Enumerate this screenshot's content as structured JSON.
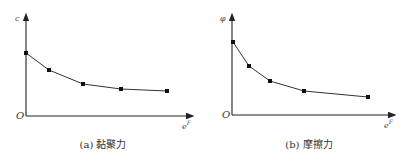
{
  "chart_data": [
    {
      "type": "line",
      "title": "(a) 黏聚力",
      "xlabel": "e^F",
      "ylabel": "c",
      "origin_label": "O",
      "x": [
        0,
        0.16,
        0.4,
        0.67,
        1.0
      ],
      "values": [
        0.63,
        0.46,
        0.32,
        0.27,
        0.25
      ],
      "series": [
        {
          "name": "c",
          "x": [
            0,
            0.16,
            0.4,
            0.67,
            1.0
          ],
          "values": [
            0.63,
            0.46,
            0.32,
            0.27,
            0.25
          ]
        }
      ],
      "grid": false,
      "ticks": "none",
      "pixel_points": [
        [
          26,
          53
        ],
        [
          49,
          70
        ],
        [
          83,
          84
        ],
        [
          121,
          89
        ],
        [
          167,
          91
        ]
      ]
    },
    {
      "type": "line",
      "title": "(b) 摩擦力",
      "xlabel": "e^F",
      "ylabel": "φ",
      "origin_label": "O",
      "x": [
        0,
        0.12,
        0.27,
        0.52,
        1.0
      ],
      "values": [
        0.73,
        0.49,
        0.34,
        0.24,
        0.18
      ],
      "series": [
        {
          "name": "φ",
          "x": [
            0,
            0.12,
            0.27,
            0.52,
            1.0
          ],
          "values": [
            0.73,
            0.49,
            0.34,
            0.24,
            0.18
          ]
        }
      ],
      "grid": false,
      "ticks": "none",
      "pixel_points": [
        [
          233,
          42
        ],
        [
          249,
          66
        ],
        [
          270,
          81
        ],
        [
          304,
          91
        ],
        [
          368,
          97
        ]
      ]
    }
  ],
  "panels": {
    "a": {
      "caption_prefix": "(a)",
      "caption_text": "黏聚力",
      "ylabel": "c",
      "xlabel_base": "e",
      "xlabel_sup": "F",
      "origin": "O"
    },
    "b": {
      "caption_prefix": "(b)",
      "caption_text": "摩擦力",
      "ylabel": "φ",
      "xlabel_base": "e",
      "xlabel_sup": "F",
      "origin": "O"
    }
  },
  "colors": {
    "line": "#333333",
    "axis": "#222222",
    "marker": "#111111"
  }
}
